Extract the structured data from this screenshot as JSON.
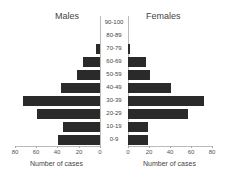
{
  "chart_data": {
    "type": "bar",
    "subtype": "population-pyramid",
    "categories": [
      "90-100",
      "80-89",
      "70-79",
      "60-69",
      "50-59",
      "40-49",
      "30-39",
      "20-29",
      "10-19",
      "0-9"
    ],
    "series": [
      {
        "name": "Males",
        "values": [
          0,
          0,
          4,
          16,
          22,
          37,
          73,
          60,
          35,
          40
        ]
      },
      {
        "name": "Females",
        "values": [
          0,
          0,
          2,
          17,
          21,
          41,
          72,
          57,
          19,
          19
        ]
      }
    ],
    "title_left": "Males",
    "title_right": "Females",
    "xlabel_left": "Number of cases",
    "xlabel_right": "Number of cases",
    "xticks_left": [
      "80",
      "60",
      "40",
      "20",
      "0"
    ],
    "xticks_right": [
      "0",
      "20",
      "40",
      "60",
      "80"
    ],
    "xlim": [
      0,
      80
    ],
    "bar_color": "#2a2a2a",
    "grid": false
  }
}
